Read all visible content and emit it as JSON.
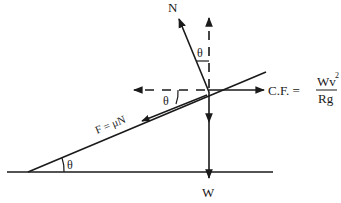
{
  "diagram": {
    "labels": {
      "normal": "N",
      "weight": "W",
      "theta_top": "θ",
      "theta_mid": "θ",
      "theta_base": "θ",
      "friction": "F = μN",
      "cf_prefix": "C.F. =",
      "cf_numerator": "Wv",
      "cf_exponent": "2",
      "cf_denominator": "Rg"
    },
    "colors": {
      "stroke": "#1a1a1a",
      "background": "#ffffff"
    }
  }
}
